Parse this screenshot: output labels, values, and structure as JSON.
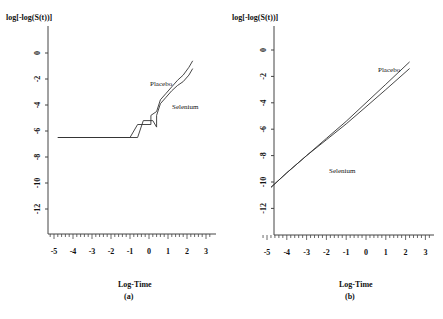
{
  "chart_data": [
    {
      "type": "line",
      "panel": "(a)",
      "title": "",
      "xlabel": "Log-Time",
      "ylabel": "log[-log(S(t))]",
      "caption": "(a)",
      "xlim": [
        -5,
        3
      ],
      "ylim": [
        -13,
        1
      ],
      "xticks": [
        -5,
        -4,
        -3,
        -2,
        -1,
        0,
        1,
        2,
        3
      ],
      "yticks": [
        0,
        -2,
        -4,
        -6,
        -8,
        -10,
        -12
      ],
      "grid": false,
      "annotations": [
        "Placebo",
        "Selenium"
      ],
      "series": [
        {
          "name": "Placebo",
          "x": [
            -4.8,
            -1.0,
            -0.6,
            -0.6,
            0.1,
            0.1,
            0.4,
            0.6,
            0.9,
            1.2,
            1.5,
            1.8,
            2.1,
            2.3
          ],
          "y": [
            -6.5,
            -6.5,
            -5.5,
            -5.5,
            -5.5,
            -4.8,
            -4.5,
            -3.6,
            -3.1,
            -2.6,
            -2.1,
            -1.7,
            -1.1,
            -0.6
          ]
        },
        {
          "name": "Selenium",
          "x": [
            -4.8,
            -0.6,
            -0.3,
            0.2,
            0.4,
            0.4,
            0.6,
            0.9,
            1.2,
            1.5,
            1.8,
            2.1,
            2.3
          ],
          "y": [
            -6.5,
            -6.5,
            -5.2,
            -5.2,
            -5.7,
            -4.8,
            -3.9,
            -3.4,
            -2.9,
            -2.5,
            -2.2,
            -1.7,
            -1.2
          ]
        }
      ]
    },
    {
      "type": "line",
      "panel": "(b)",
      "title": "",
      "xlabel": "Log-Time",
      "ylabel": "log[-log(S(t))]",
      "caption": "(b)",
      "xlim": [
        -5,
        3
      ],
      "ylim": [
        -13,
        1
      ],
      "xticks": [
        -5,
        -4,
        -3,
        -2,
        -1,
        0,
        1,
        2,
        3
      ],
      "yticks": [
        0,
        -2,
        -4,
        -6,
        -8,
        -10,
        -12
      ],
      "grid": false,
      "annotations": [
        "Placebo",
        "Selenium"
      ],
      "series": [
        {
          "name": "Placebo",
          "x": [
            -4.8,
            -4.0,
            -3.0,
            -2.0,
            -1.0,
            0.0,
            1.0,
            2.2
          ],
          "y": [
            -10.4,
            -9.3,
            -8.0,
            -6.7,
            -5.4,
            -4.0,
            -2.6,
            -0.9
          ]
        },
        {
          "name": "Selenium",
          "x": [
            -4.8,
            -4.0,
            -3.0,
            -2.0,
            -1.0,
            0.0,
            1.0,
            2.2
          ],
          "y": [
            -10.4,
            -9.3,
            -8.0,
            -6.8,
            -5.6,
            -4.3,
            -3.0,
            -1.4
          ]
        }
      ]
    }
  ],
  "panels": {
    "a": {
      "ylabel": "log[-log(S(t))]",
      "xlabel": "Log-Time",
      "caption": "(a)",
      "placebo_label": "Placebo",
      "selenium_label": "Selenium",
      "xtick_labels": [
        "-5",
        "-4",
        "-3",
        "-2",
        "-1",
        "0",
        "1",
        "2",
        "3"
      ],
      "ytick_labels": [
        "0",
        "-2",
        "-4",
        "-6",
        "-8",
        "-10",
        "-12"
      ]
    },
    "b": {
      "ylabel": "log[-log(S(t))]",
      "xlabel": "Log-Time",
      "caption": "(b)",
      "placebo_label": "Placebo",
      "selenium_label": "Selenium",
      "xtick_labels": [
        "-5",
        "-4",
        "-3",
        "-2",
        "-1",
        "0",
        "1",
        "2",
        "3"
      ],
      "ytick_labels": [
        "0",
        "-2",
        "-4",
        "-6",
        "-8",
        "-10",
        "-12"
      ]
    }
  },
  "colors": {
    "line": "#333333",
    "axis": "#444444",
    "background": "#ffffff"
  }
}
